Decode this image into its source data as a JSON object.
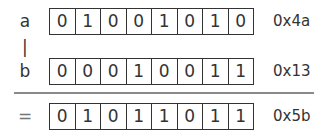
{
  "operation": "|",
  "rows": [
    {
      "label": "a",
      "bits": [
        "0",
        "1",
        "0",
        "0",
        "1",
        "0",
        "1",
        "0"
      ],
      "hex": "0x4a"
    },
    {
      "label": "b",
      "bits": [
        "0",
        "0",
        "0",
        "1",
        "0",
        "0",
        "1",
        "1"
      ],
      "hex": "0x13"
    },
    {
      "label": "=",
      "bits": [
        "0",
        "1",
        "0",
        "1",
        "1",
        "0",
        "1",
        "1"
      ],
      "hex": "0x5b"
    }
  ]
}
